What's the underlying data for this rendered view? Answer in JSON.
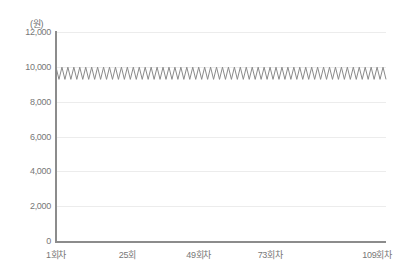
{
  "chart_data": {
    "type": "line",
    "title": "",
    "subtitle": "",
    "xlabel": "",
    "ylabel": "",
    "unit_label": "(원)",
    "ylim": [
      0,
      12000
    ],
    "y_ticks": [
      0,
      2000,
      4000,
      6000,
      8000,
      10000,
      12000
    ],
    "y_tick_labels": [
      "0",
      "2,000",
      "4,000",
      "6,000",
      "8,000",
      "10,000",
      "12,000"
    ],
    "grid": true,
    "grid_axis": "y",
    "legend": false,
    "legend_position": "none",
    "xlim": [
      1,
      112
    ],
    "x_tick_positions": [
      1,
      25,
      49,
      73,
      109
    ],
    "x_tick_labels": [
      "1회차",
      "25회",
      "49회차",
      "73회차",
      "109회차"
    ],
    "series": [
      {
        "name": "",
        "color": "#8a8a8a",
        "peak_value": 9980,
        "trough_value": 9280,
        "oscillation_period": 2,
        "x": [
          1,
          2,
          3,
          4,
          5,
          6,
          7,
          8,
          9,
          10,
          11,
          12,
          13,
          14,
          15,
          16,
          17,
          18,
          19,
          20,
          21,
          22,
          23,
          24,
          25,
          26,
          27,
          28,
          29,
          30,
          31,
          32,
          33,
          34,
          35,
          36,
          37,
          38,
          39,
          40,
          41,
          42,
          43,
          44,
          45,
          46,
          47,
          48,
          49,
          50,
          51,
          52,
          53,
          54,
          55,
          56,
          57,
          58,
          59,
          60,
          61,
          62,
          63,
          64,
          65,
          66,
          67,
          68,
          69,
          70,
          71,
          72,
          73,
          74,
          75,
          76,
          77,
          78,
          79,
          80,
          81,
          82,
          83,
          84,
          85,
          86,
          87,
          88,
          89,
          90,
          91,
          92,
          93,
          94,
          95,
          96,
          97,
          98,
          99,
          100,
          101,
          102,
          103,
          104,
          105,
          106,
          107,
          108,
          109,
          110,
          111,
          112
        ],
        "values": [
          9980,
          9280,
          9980,
          9280,
          9980,
          9280,
          9980,
          9280,
          9980,
          9280,
          9980,
          9280,
          9980,
          9280,
          9980,
          9280,
          9980,
          9280,
          9980,
          9280,
          9980,
          9280,
          9980,
          9280,
          9980,
          9280,
          9980,
          9280,
          9980,
          9280,
          9980,
          9280,
          9980,
          9280,
          9980,
          9280,
          9980,
          9280,
          9980,
          9280,
          9980,
          9280,
          9980,
          9280,
          9980,
          9280,
          9980,
          9280,
          9980,
          9280,
          9980,
          9280,
          9980,
          9280,
          9980,
          9280,
          9980,
          9280,
          9980,
          9280,
          9980,
          9280,
          9980,
          9280,
          9980,
          9280,
          9980,
          9280,
          9980,
          9280,
          9980,
          9280,
          9980,
          9280,
          9980,
          9280,
          9980,
          9280,
          9980,
          9280,
          9980,
          9280,
          9980,
          9280,
          9980,
          9280,
          9980,
          9280,
          9980,
          9280,
          9980,
          9280,
          9980,
          9280,
          9980,
          9280,
          9980,
          9280,
          9980,
          9280,
          9980,
          9280,
          9980,
          9280,
          9980,
          9280,
          9980,
          9280,
          9980,
          9280,
          9980,
          9280
        ]
      }
    ]
  },
  "colors": {
    "line": "#8a8a8a",
    "axis": "#8c8c8c",
    "grid": "#ececec",
    "tick_text": "#777777",
    "unit_text": "#6e6e6e",
    "background": "#ffffff"
  }
}
